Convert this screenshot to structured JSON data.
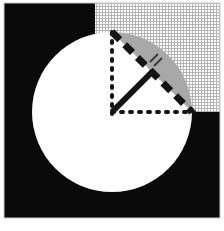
{
  "figure": {
    "canvas": {
      "width": 224,
      "height": 231
    },
    "colors": {
      "background": "#ffffff",
      "exterior_fill": "#0a0a0a",
      "circle_fill": "#ffffff",
      "segment_fill": "#a8a8a8",
      "hatch_fill": "#ffffff",
      "hatch_line": "#b8b8b8",
      "line_stroke": "#141414",
      "border": "#c8c8c8"
    },
    "plate": {
      "x": 4,
      "y": 3,
      "width": 216,
      "height": 215
    },
    "quadrant_patch": {
      "x": 95,
      "y": 3,
      "width": 125,
      "height": 109,
      "pattern": "fine-cross-hatch",
      "cell": 3
    },
    "circle": {
      "cx": 112,
      "cy": 112,
      "r": 80,
      "stroke_width": 0
    },
    "segment": {
      "chord_start_deg": 270,
      "chord_end_deg": 0,
      "label": "minor-segment",
      "fill": "#a8a8a8"
    },
    "chord": {
      "x1": 112,
      "y1": 32,
      "x2": 192,
      "y2": 112,
      "style": "dashed",
      "dash": "11 7",
      "width": 7
    },
    "dotted_vertical": {
      "x1": 112,
      "y1": 32,
      "x2": 112,
      "y2": 112,
      "style": "dotted",
      "dash": "2 7",
      "width": 4
    },
    "dotted_horizontal": {
      "x1": 112,
      "y1": 112,
      "x2": 192,
      "y2": 112,
      "style": "dotted",
      "dash": "2 7",
      "width": 4
    },
    "apothem": {
      "x1": 112,
      "y1": 112,
      "x2": 152,
      "y2": 72,
      "style": "solid",
      "width": 6,
      "label": "perpendicular-radius"
    },
    "right_angle_ticks": {
      "count": 2,
      "label": "congruence-tick-marks",
      "marks": [
        {
          "x1": 150,
          "y1": 62,
          "x2": 158,
          "y2": 54
        },
        {
          "x1": 154,
          "y1": 65,
          "x2": 162,
          "y2": 57
        }
      ]
    }
  }
}
